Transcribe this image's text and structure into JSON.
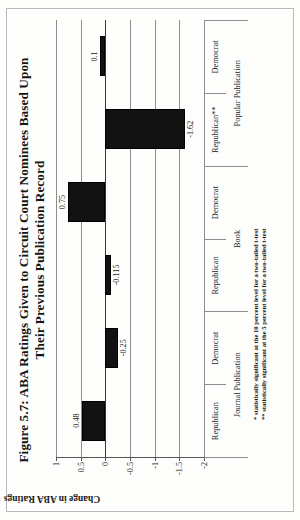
{
  "figure": {
    "title_line1": "Figure 5.7: ABA Ratings Given to Circuit Court Nominees Based Upon",
    "title_line2": "Their Previous Publication Record",
    "note1": "* statistically significant at the 10 percent level for a two-tailed t-test",
    "note2": "** statistically significant at the 5 percent level for a two-tailed t-test"
  },
  "chart_data": {
    "type": "bar",
    "title": "Figure 5.7: ABA Ratings Given to Circuit Court Nominees Based Upon Their Previous Publication Record",
    "xlabel": "",
    "ylabel": "Change in ABA Ratings",
    "ylim": [
      -2,
      1
    ],
    "yticks": [
      1,
      0.5,
      0,
      -0.5,
      -1,
      -1.5,
      -2
    ],
    "ytick_labels": [
      "1",
      "0.5",
      "0",
      "-0.5",
      "-1",
      "-1.5",
      "-2"
    ],
    "grid": true,
    "legend": "none",
    "orientation": "vertical",
    "categories": [
      "Republican",
      "Democrat",
      "Republican",
      "Democrat",
      "Republican**",
      "Democrat"
    ],
    "group_labels": [
      "Journal Publication",
      "Book",
      "Popular Publication"
    ],
    "values": [
      0.48,
      -0.25,
      -0.115,
      0.75,
      -1.62,
      0.1
    ],
    "data_labels": [
      "0.48",
      "-0.25",
      "-0.115",
      "0.75",
      "-1.62",
      "0.1"
    ],
    "bar_color": "#121212"
  }
}
